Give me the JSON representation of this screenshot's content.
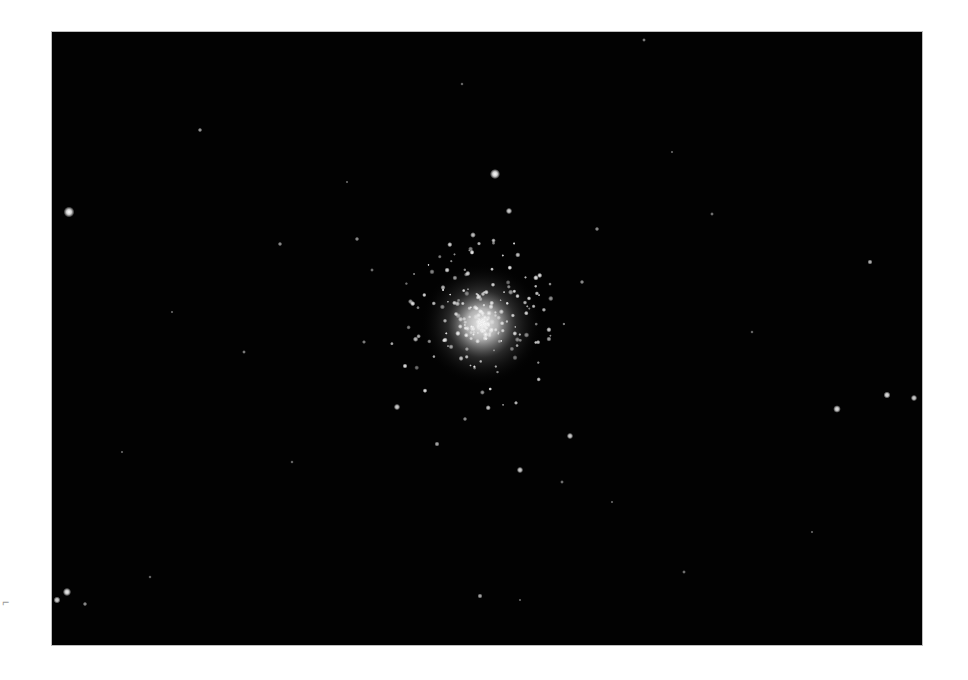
{
  "image": {
    "subject": "globular star cluster on black sky",
    "background_color": "#020202",
    "frame": {
      "x": 52,
      "y": 32,
      "width": 870,
      "height": 613
    },
    "cluster_core": {
      "cx": 430,
      "cy": 292,
      "r_core": 28,
      "r_halo": 95
    }
  },
  "stars": [
    {
      "x": 17,
      "y": 180,
      "r": 3.4,
      "o": 1.0
    },
    {
      "x": 443,
      "y": 142,
      "r": 3.2,
      "o": 1.0
    },
    {
      "x": 15,
      "y": 560,
      "r": 2.6,
      "o": 0.95
    },
    {
      "x": 785,
      "y": 377,
      "r": 2.4,
      "o": 0.9
    },
    {
      "x": 835,
      "y": 363,
      "r": 2.2,
      "o": 0.9
    },
    {
      "x": 862,
      "y": 366,
      "r": 2.0,
      "o": 0.85
    },
    {
      "x": 818,
      "y": 230,
      "r": 1.6,
      "o": 0.75
    },
    {
      "x": 345,
      "y": 375,
      "r": 2.0,
      "o": 0.85
    },
    {
      "x": 457,
      "y": 179,
      "r": 2.0,
      "o": 0.85
    },
    {
      "x": 421,
      "y": 203,
      "r": 1.8,
      "o": 0.8
    },
    {
      "x": 468,
      "y": 438,
      "r": 2.0,
      "o": 0.85
    },
    {
      "x": 518,
      "y": 404,
      "r": 2.0,
      "o": 0.85
    },
    {
      "x": 428,
      "y": 564,
      "r": 1.6,
      "o": 0.7
    },
    {
      "x": 148,
      "y": 98,
      "r": 1.4,
      "o": 0.65
    },
    {
      "x": 228,
      "y": 212,
      "r": 1.4,
      "o": 0.6
    },
    {
      "x": 192,
      "y": 320,
      "r": 1.2,
      "o": 0.55
    },
    {
      "x": 5,
      "y": 568,
      "r": 2.2,
      "o": 0.85
    },
    {
      "x": 33,
      "y": 572,
      "r": 1.4,
      "o": 0.6
    },
    {
      "x": 592,
      "y": 8,
      "r": 1.2,
      "o": 0.55
    },
    {
      "x": 545,
      "y": 197,
      "r": 1.4,
      "o": 0.6
    },
    {
      "x": 660,
      "y": 182,
      "r": 1.2,
      "o": 0.5
    },
    {
      "x": 305,
      "y": 207,
      "r": 1.4,
      "o": 0.6
    },
    {
      "x": 320,
      "y": 238,
      "r": 1.2,
      "o": 0.5
    },
    {
      "x": 385,
      "y": 412,
      "r": 1.6,
      "o": 0.7
    },
    {
      "x": 413,
      "y": 387,
      "r": 1.4,
      "o": 0.6
    },
    {
      "x": 510,
      "y": 450,
      "r": 1.2,
      "o": 0.5
    },
    {
      "x": 530,
      "y": 250,
      "r": 1.4,
      "o": 0.6
    },
    {
      "x": 312,
      "y": 310,
      "r": 1.3,
      "o": 0.55
    },
    {
      "x": 632,
      "y": 540,
      "r": 1.2,
      "o": 0.5
    },
    {
      "x": 98,
      "y": 545,
      "r": 1.1,
      "o": 0.45
    },
    {
      "x": 410,
      "y": 52,
      "r": 1.1,
      "o": 0.45
    },
    {
      "x": 240,
      "y": 430,
      "r": 1.1,
      "o": 0.45
    },
    {
      "x": 700,
      "y": 300,
      "r": 1.1,
      "o": 0.45
    },
    {
      "x": 120,
      "y": 280,
      "r": 1.0,
      "o": 0.4
    },
    {
      "x": 560,
      "y": 470,
      "r": 1.0,
      "o": 0.4
    },
    {
      "x": 468,
      "y": 568,
      "r": 1.0,
      "o": 0.4
    },
    {
      "x": 760,
      "y": 500,
      "r": 1.0,
      "o": 0.4
    },
    {
      "x": 295,
      "y": 150,
      "r": 1.0,
      "o": 0.4
    },
    {
      "x": 620,
      "y": 120,
      "r": 1.0,
      "o": 0.4
    },
    {
      "x": 70,
      "y": 420,
      "r": 1.0,
      "o": 0.4
    }
  ],
  "cluster_members_seed": 7,
  "cluster_members_count": 260
}
